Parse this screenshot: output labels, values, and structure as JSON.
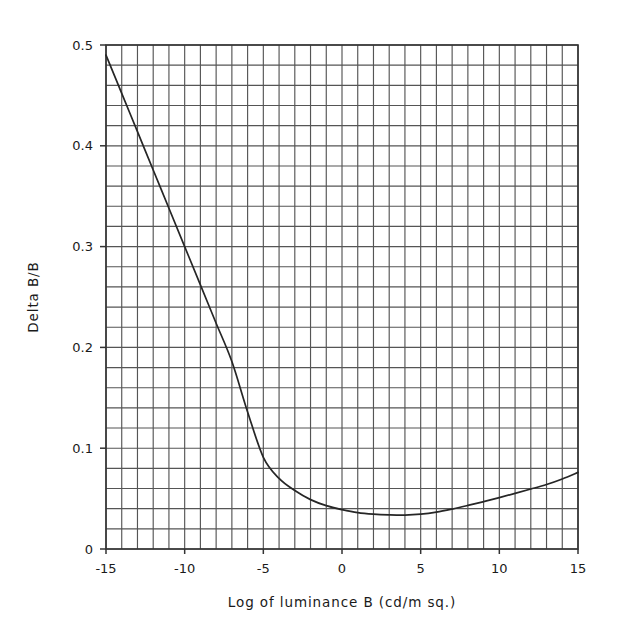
{
  "chart_data": {
    "type": "line",
    "title": "",
    "subtitle": "",
    "xlabel": "Log of luminance B (cd/m sq.)",
    "ylabel": "Delta B/B",
    "xlim": [
      -15,
      15
    ],
    "ylim": [
      0,
      0.5
    ],
    "grid": true,
    "grid_x_step": 1,
    "grid_y_step": 0.02,
    "legend": null,
    "legend_position": "none",
    "xticks": [
      -15,
      -10,
      -5,
      0,
      5,
      10,
      15
    ],
    "xtick_labels": [
      "-15",
      "-10",
      "-5",
      "0",
      "5",
      "10",
      "15"
    ],
    "yticks": [
      0,
      0.1,
      0.2,
      0.3,
      0.4,
      0.5
    ],
    "ytick_labels": [
      "0",
      "0.1",
      "0.2",
      "0.3",
      "0.4",
      "0.5"
    ],
    "line_color": "#262626",
    "grid_color": "#555555",
    "axis_color": "#333333",
    "series": [
      {
        "name": "Delta B/B",
        "x": [
          -15,
          -14,
          -13,
          -12,
          -11,
          -10,
          -9,
          -8,
          -7,
          -6,
          -5,
          -4,
          -3,
          -2,
          -1,
          0,
          1,
          2,
          3,
          4,
          5,
          6,
          7,
          8,
          9,
          10,
          11,
          12,
          13,
          14,
          15
        ],
        "values": [
          0.49,
          0.452,
          0.414,
          0.376,
          0.338,
          0.3,
          0.262,
          0.224,
          0.186,
          0.136,
          0.091,
          0.07,
          0.058,
          0.049,
          0.043,
          0.039,
          0.036,
          0.0345,
          0.0338,
          0.0336,
          0.0345,
          0.0365,
          0.0396,
          0.0432,
          0.047,
          0.051,
          0.0552,
          0.0595,
          0.064,
          0.0695,
          0.076
        ]
      }
    ],
    "annotations": []
  },
  "figure": {
    "x_axis_label": "Log of luminance B (cd/m sq.)",
    "y_axis_label": "Delta B/B"
  }
}
